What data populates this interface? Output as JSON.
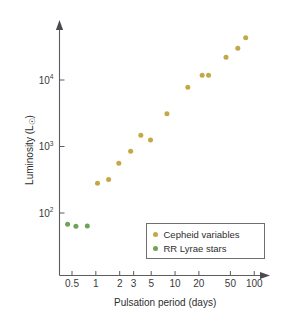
{
  "chart_data": {
    "type": "scatter",
    "title": "",
    "xlabel": "Pulsation period (days)",
    "ylabel": "Luminosity (L☉)",
    "xscale": "log",
    "yscale": "log",
    "xlim": [
      0.38,
      130
    ],
    "ylim": [
      30,
      70000
    ],
    "grid": false,
    "legend_position": "lower-right",
    "xticks": [
      "0.5",
      "1",
      "2",
      "3",
      "5",
      "10",
      "20",
      "50",
      "100"
    ],
    "xtick_values": [
      0.5,
      1,
      2,
      3,
      5,
      10,
      20,
      50,
      100
    ],
    "yticks": [
      "10⁴",
      "10³",
      "10²"
    ],
    "ytick_values": [
      10000,
      1000,
      100
    ],
    "ytick_mantissa": [
      "10",
      "10",
      "10"
    ],
    "ytick_exponent": [
      "4",
      "3",
      "2"
    ],
    "series": [
      {
        "name": "Cepheid variables",
        "color": "#c4a747",
        "marker": "circle",
        "points": [
          {
            "x": 1.05,
            "y": 280
          },
          {
            "x": 1.45,
            "y": 320
          },
          {
            "x": 1.95,
            "y": 560
          },
          {
            "x": 2.75,
            "y": 850
          },
          {
            "x": 3.7,
            "y": 1480
          },
          {
            "x": 4.9,
            "y": 1250
          },
          {
            "x": 7.9,
            "y": 3100
          },
          {
            "x": 14.5,
            "y": 7800
          },
          {
            "x": 22.0,
            "y": 11800
          },
          {
            "x": 26.5,
            "y": 11800
          },
          {
            "x": 44.0,
            "y": 22000
          },
          {
            "x": 62.0,
            "y": 30000
          },
          {
            "x": 78.0,
            "y": 43000
          }
        ]
      },
      {
        "name": "RR Lyrae stars",
        "color": "#6da35a",
        "marker": "circle",
        "points": [
          {
            "x": 0.44,
            "y": 68
          },
          {
            "x": 0.56,
            "y": 63
          },
          {
            "x": 0.78,
            "y": 64
          }
        ]
      }
    ]
  },
  "legend": {
    "entries": [
      {
        "label": "Cepheid variables",
        "color": "#c4a747"
      },
      {
        "label": "RR Lyrae stars",
        "color": "#6da35a"
      }
    ]
  },
  "axes": {
    "x_title": "Pulsation period (days)",
    "y_title_main": "Luminosity (L",
    "y_title_sun": "☉",
    "y_title_close": ")",
    "y_title_full": "Luminosity (L☉)"
  }
}
